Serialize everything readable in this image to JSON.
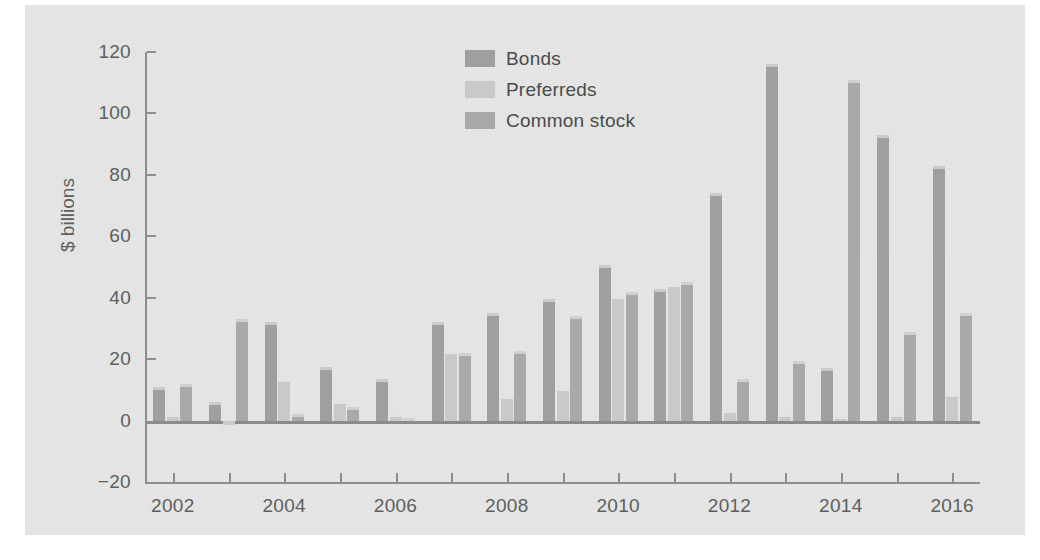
{
  "figure": {
    "background_color": "#e6e7e6",
    "axis_color": "#8d8f8e",
    "text_color": "#5d5f5e"
  },
  "legend": {
    "position": "top-center",
    "items": [
      {
        "label": "Bonds",
        "color": "#9e9f9e"
      },
      {
        "label": "Preferreds",
        "color": "#c9cac8"
      },
      {
        "label": "Common stock",
        "color": "#a9aaa8"
      }
    ]
  },
  "chart_data": {
    "type": "bar",
    "title": "",
    "subtitle": "",
    "xlabel": "",
    "ylabel": "$ billions",
    "ylim": [
      -20,
      120
    ],
    "yticks": [
      -20,
      0,
      20,
      40,
      60,
      80,
      100,
      120
    ],
    "ytick_labels": [
      "−20",
      "0",
      "20",
      "40",
      "60",
      "80",
      "100",
      "120"
    ],
    "grid": false,
    "legend_position": "top-center",
    "xlim": [
      2001.5,
      2016.5
    ],
    "xticks": [
      2002,
      2003,
      2004,
      2005,
      2006,
      2007,
      2008,
      2009,
      2010,
      2011,
      2012,
      2013,
      2014,
      2015,
      2016
    ],
    "xtick_labels_shown": [
      "2002",
      "2004",
      "2006",
      "2008",
      "2010",
      "2012",
      "2014",
      "2016"
    ],
    "categories": [
      2002,
      2003,
      2004,
      2005,
      2006,
      2007,
      2008,
      2009,
      2010,
      2011,
      2012,
      2013,
      2014,
      2015,
      2016
    ],
    "series": [
      {
        "name": "Bonds",
        "color": "#9e9f9e",
        "values": [
          11,
          6,
          32,
          17.5,
          13.5,
          32,
          35,
          39.5,
          50.5,
          43,
          74,
          116,
          17,
          93,
          83
        ]
      },
      {
        "name": "Preferreds",
        "color": "#c9cac8",
        "values": [
          2,
          -1.5,
          13.5,
          6.5,
          2,
          22.5,
          8,
          10.5,
          40.5,
          44.5,
          3.5,
          2,
          1.5,
          2,
          8.5
        ]
      },
      {
        "name": "Common stock",
        "color": "#a9aaa8",
        "values": [
          12,
          33,
          2,
          4.5,
          1,
          22,
          22.5,
          34,
          42,
          45,
          13.5,
          19.5,
          111,
          29,
          35
        ]
      }
    ],
    "units": "$ billions",
    "bar_top_highlight": true
  }
}
